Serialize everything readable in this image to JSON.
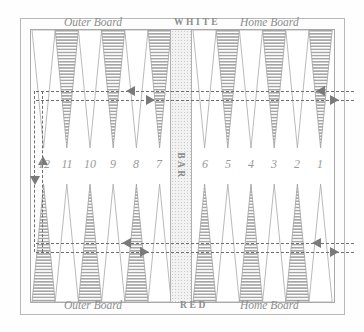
{
  "board": {
    "title": "Backgammon board diagram",
    "labels": {
      "top_left": "Outer Board",
      "top_center": "WHITE",
      "top_right": "Home Board",
      "bottom_left": "Outer Board",
      "bottom_center": "RED",
      "bottom_right": "Home Board",
      "bar": "BAR"
    },
    "colors": {
      "background": "#ffffff",
      "frame": "#b8b8b8",
      "point_hatch": "#9a9a9a",
      "point_outline": "#a0a0a0",
      "bar_fill": "#f2f2f2",
      "text": "#8d8d8d",
      "arrow": "#7a7a7a"
    },
    "point_numbers": [
      "12",
      "11",
      "10",
      "9",
      "8",
      "7",
      "6",
      "5",
      "4",
      "3",
      "2",
      "1"
    ],
    "top_points": [
      {
        "number": "12",
        "fill": "white"
      },
      {
        "number": "11",
        "fill": "hatched"
      },
      {
        "number": "10",
        "fill": "white"
      },
      {
        "number": "9",
        "fill": "hatched"
      },
      {
        "number": "8",
        "fill": "white"
      },
      {
        "number": "7",
        "fill": "hatched"
      },
      {
        "number": "6",
        "fill": "white"
      },
      {
        "number": "5",
        "fill": "hatched"
      },
      {
        "number": "4",
        "fill": "white"
      },
      {
        "number": "3",
        "fill": "hatched"
      },
      {
        "number": "2",
        "fill": "white"
      },
      {
        "number": "1",
        "fill": "hatched"
      }
    ],
    "bottom_points": [
      {
        "number": "12",
        "fill": "hatched"
      },
      {
        "number": "11",
        "fill": "white"
      },
      {
        "number": "10",
        "fill": "hatched"
      },
      {
        "number": "9",
        "fill": "white"
      },
      {
        "number": "8",
        "fill": "hatched"
      },
      {
        "number": "7",
        "fill": "white"
      },
      {
        "number": "6",
        "fill": "hatched"
      },
      {
        "number": "5",
        "fill": "white"
      },
      {
        "number": "4",
        "fill": "hatched"
      },
      {
        "number": "3",
        "fill": "white"
      },
      {
        "number": "2",
        "fill": "hatched"
      },
      {
        "number": "1",
        "fill": "white"
      }
    ],
    "movement": {
      "white_direction": "leftward along top row then down and leftward along bottom row",
      "red_direction": "rightward along bottom row then up and rightward along top row",
      "arrow_count": 8
    }
  }
}
